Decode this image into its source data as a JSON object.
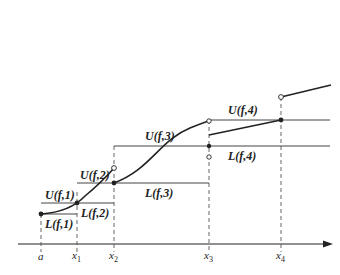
{
  "figure": {
    "axis_labels": {
      "a": "a",
      "x1": "x",
      "x1_sub": "1",
      "x2": "x",
      "x2_sub": "2",
      "x3": "x",
      "x3_sub": "3",
      "x4": "x",
      "x4_sub": "4"
    },
    "sum_labels": {
      "U1": "U(f,1)",
      "L1": "L(f,1)",
      "L2": "L(f,2)",
      "U2": "U(f,2)",
      "L3": "L(f,3)",
      "U3": "U(f,3)",
      "L4": "L(f,4)",
      "U4": "U(f,4)"
    },
    "colors": {
      "ink": "#222222",
      "guide": "#555555"
    }
  }
}
